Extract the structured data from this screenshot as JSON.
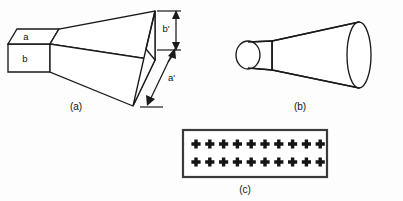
{
  "figure": {
    "background_color": "#fdfdfd",
    "line_color": "#1a1a1a",
    "panel_border_color": "#3a3a3a"
  },
  "panels": [
    {
      "id": "pyramidal-horn",
      "caption": "(a)",
      "description": "Pyramidal horn antenna",
      "labels": {
        "waveguide_top": "a",
        "waveguide_front": "b",
        "aperture_height": "b'",
        "aperture_width": "a'"
      }
    },
    {
      "id": "conical-horn",
      "caption": "(b)",
      "description": "Conical horn antenna",
      "labels": {}
    },
    {
      "id": "slot-array",
      "caption": "(c)",
      "description": "Array of radiating elements",
      "array": {
        "rows": 2,
        "columns": 10,
        "element_symbol": "+"
      }
    }
  ]
}
